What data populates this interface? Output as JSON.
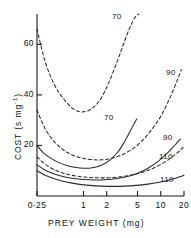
{
  "chart_data": {
    "type": "line",
    "title": "",
    "xlabel": "PREY  WEIGHT  (mg)",
    "ylabel": "COST (s mg",
    "ylabel_sup": "-1",
    "ylabel_tail": ")",
    "xscale": "log",
    "xlim": [
      0.25,
      20
    ],
    "ylim": [
      0,
      72
    ],
    "xticks": [
      0.25,
      1,
      2,
      5,
      10,
      20
    ],
    "xticklabels": [
      "0·25",
      "1",
      "2",
      "5",
      "10",
      "20"
    ],
    "yticks": [
      20,
      40,
      60
    ],
    "yticklabels": [
      "20",
      "40",
      "60"
    ],
    "grid": false,
    "legend": "inline-end-labels",
    "series": [
      {
        "name": "70-dashed",
        "label": "70",
        "style": "dashed",
        "x": [
          0.25,
          0.32,
          0.42,
          0.55,
          0.7,
          0.85,
          1.0,
          1.2,
          1.45,
          1.75,
          2.1,
          2.6,
          3.2,
          3.9,
          4.6,
          5.2
        ],
        "y": [
          66.0,
          53.0,
          44.0,
          38.5,
          35.0,
          33.5,
          33.3,
          34.0,
          36.0,
          39.5,
          44.5,
          51.5,
          59.0,
          66.0,
          70.5,
          72.0
        ]
      },
      {
        "name": "90-dashed",
        "label": "90",
        "style": "dashed",
        "x": [
          0.25,
          0.32,
          0.42,
          0.55,
          0.72,
          0.95,
          1.25,
          1.7,
          2.3,
          3.1,
          4.2,
          5.6,
          7.5,
          10.0,
          13.0,
          16.0,
          18.5
        ],
        "y": [
          34.0,
          26.5,
          21.5,
          18.2,
          16.2,
          15.0,
          14.4,
          14.3,
          14.9,
          16.2,
          18.4,
          21.5,
          26.0,
          31.5,
          38.5,
          45.0,
          50.0
        ]
      },
      {
        "name": "110-dashed",
        "label": "110",
        "style": "dashed",
        "x": [
          0.25,
          0.33,
          0.45,
          0.6,
          0.8,
          1.1,
          1.5,
          2.1,
          3.0,
          4.2,
          5.8,
          8.0,
          11.0,
          14.0,
          17.0,
          19.5
        ],
        "y": [
          15.5,
          12.2,
          10.0,
          8.7,
          7.9,
          7.4,
          7.2,
          7.2,
          7.6,
          8.3,
          9.4,
          11.0,
          13.2,
          15.4,
          17.5,
          19.2
        ]
      },
      {
        "name": "70-solid",
        "label": "70",
        "style": "solid",
        "x": [
          0.25,
          0.3,
          0.38,
          0.48,
          0.62,
          0.8,
          1.0,
          1.3,
          1.7,
          2.2,
          2.8,
          3.4,
          4.0,
          4.5,
          4.9
        ],
        "y": [
          20.0,
          17.2,
          14.9,
          13.2,
          12.0,
          11.3,
          11.0,
          11.2,
          12.2,
          14.2,
          17.5,
          21.5,
          25.5,
          28.5,
          30.5
        ]
      },
      {
        "name": "90-solid",
        "label": "90",
        "style": "solid",
        "x": [
          0.25,
          0.32,
          0.42,
          0.56,
          0.75,
          1.0,
          1.4,
          1.9,
          2.7,
          3.8,
          5.2,
          7.0,
          9.5,
          12.0,
          14.5,
          16.5,
          18.0
        ],
        "y": [
          12.4,
          10.2,
          8.7,
          7.6,
          6.9,
          6.5,
          6.3,
          6.4,
          6.9,
          7.8,
          9.2,
          11.2,
          14.0,
          16.8,
          19.4,
          21.3,
          22.5
        ]
      },
      {
        "name": "110-solid",
        "label": "110",
        "style": "solid",
        "x": [
          0.25,
          0.33,
          0.45,
          0.62,
          0.85,
          1.2,
          1.7,
          2.4,
          3.4,
          4.8,
          6.8,
          9.5,
          12.5,
          15.5,
          18.0,
          20.0
        ],
        "y": [
          10.0,
          8.0,
          6.5,
          5.4,
          4.7,
          4.2,
          3.9,
          3.8,
          3.9,
          4.2,
          4.7,
          5.4,
          6.2,
          7.0,
          7.7,
          8.2
        ]
      }
    ],
    "curve_labels": [
      {
        "text": "70",
        "style": "dashed",
        "x": 112,
        "y": 12
      },
      {
        "text": "90",
        "style": "dashed",
        "x": 166,
        "y": 68
      },
      {
        "text": "110",
        "style": "dashed",
        "x": 159,
        "y": 152
      },
      {
        "text": "70",
        "style": "solid",
        "x": 104,
        "y": 113
      },
      {
        "text": "90",
        "style": "solid",
        "x": 163,
        "y": 133
      },
      {
        "text": "110",
        "style": "solid",
        "x": 160,
        "y": 175
      }
    ],
    "colors": {
      "axis": "#1a1a1a",
      "curve": "#2a2a2a"
    }
  }
}
